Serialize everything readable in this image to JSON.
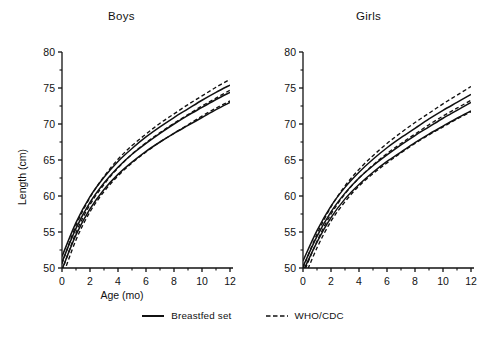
{
  "figure": {
    "panels": [
      {
        "key": "boys",
        "title": "Boys"
      },
      {
        "key": "girls",
        "title": "Girls"
      }
    ],
    "axis_label_x": "Age (mo)",
    "axis_label_y": "Length (cm)"
  },
  "legend": {
    "items": [
      {
        "label": "Breastfed set",
        "style": "solid",
        "icon": "solid-line-icon"
      },
      {
        "label": "WHO/CDC",
        "style": "dashed",
        "icon": "dashed-line-icon"
      }
    ]
  },
  "axes": {
    "x_ticks": [
      "0",
      "2",
      "4",
      "6",
      "8",
      "10",
      "12"
    ],
    "y_ticks": [
      "50",
      "55",
      "60",
      "65",
      "70",
      "75",
      "80"
    ],
    "xlim": [
      0,
      12
    ],
    "ylim": [
      50,
      80
    ]
  },
  "chart_data": {
    "type": "line",
    "title": "",
    "xlabel": "Age (mo)",
    "ylabel": "Length (cm)",
    "xlim": [
      0,
      12
    ],
    "ylim": [
      50,
      80
    ],
    "x_ticks": [
      0,
      2,
      4,
      6,
      8,
      10,
      12
    ],
    "y_ticks": [
      50,
      55,
      60,
      65,
      70,
      75,
      80
    ],
    "grid": false,
    "legend_position": "bottom-center",
    "legend": [
      "Breastfed set",
      "WHO/CDC"
    ],
    "panels": [
      {
        "name": "Boys",
        "x": [
          0,
          1,
          2,
          3,
          4,
          5,
          6,
          7,
          8,
          9,
          10,
          11,
          12
        ],
        "series": [
          {
            "name": "Breastfed set upper",
            "group": "Breastfed set",
            "style": "solid",
            "values": [
              51.6,
              56.3,
              59.9,
              62.6,
              64.8,
              66.6,
              68.2,
              69.6,
              70.9,
              72.1,
              73.3,
              74.4,
              75.4
            ]
          },
          {
            "name": "Breastfed set median",
            "group": "Breastfed set",
            "style": "solid",
            "values": [
              50.8,
              55.5,
              59.1,
              61.8,
              64.0,
              65.8,
              67.3,
              68.7,
              70.0,
              71.2,
              72.3,
              73.4,
              74.4
            ]
          },
          {
            "name": "Breastfed set lower",
            "group": "Breastfed set",
            "style": "solid",
            "values": [
              49.8,
              54.6,
              58.2,
              60.9,
              63.0,
              64.7,
              66.2,
              67.5,
              68.7,
              69.8,
              70.9,
              72.0,
              73.0
            ]
          },
          {
            "name": "WHO/CDC upper",
            "group": "WHO/CDC",
            "style": "dashed",
            "values": [
              50.6,
              55.9,
              59.8,
              62.7,
              65.1,
              67.0,
              68.6,
              70.1,
              71.4,
              72.7,
              73.9,
              75.1,
              76.2
            ]
          },
          {
            "name": "WHO/CDC median",
            "group": "WHO/CDC",
            "style": "dashed",
            "values": [
              49.6,
              54.9,
              58.8,
              61.6,
              63.9,
              65.8,
              67.4,
              68.8,
              70.1,
              71.3,
              72.5,
              73.6,
              74.7
            ]
          },
          {
            "name": "WHO/CDC lower",
            "group": "WHO/CDC",
            "style": "dashed",
            "values": [
              48.6,
              53.9,
              57.8,
              60.6,
              62.8,
              64.6,
              66.1,
              67.5,
              68.7,
              69.9,
              71.1,
              72.2,
              73.2
            ]
          }
        ],
        "value_at_12mo": {
          "breastfed_upper": 75.4,
          "breastfed_median": 74.4,
          "breastfed_lower": 73.0,
          "whocdc_upper": 76.2,
          "whocdc_median": 74.7,
          "whocdc_lower": 73.2
        }
      },
      {
        "name": "Girls",
        "x": [
          0,
          1,
          2,
          3,
          4,
          5,
          6,
          7,
          8,
          9,
          10,
          11,
          12
        ],
        "series": [
          {
            "name": "Breastfed set upper",
            "group": "Breastfed set",
            "style": "solid",
            "values": [
              51.0,
              55.2,
              58.6,
              61.2,
              63.3,
              65.1,
              66.7,
              68.1,
              69.4,
              70.7,
              71.9,
              73.0,
              74.1
            ]
          },
          {
            "name": "Breastfed set median",
            "group": "Breastfed set",
            "style": "solid",
            "values": [
              50.2,
              54.4,
              57.8,
              60.4,
              62.5,
              64.2,
              65.7,
              67.1,
              68.4,
              69.6,
              70.8,
              71.9,
              73.0
            ]
          },
          {
            "name": "Breastfed set lower",
            "group": "Breastfed set",
            "style": "solid",
            "values": [
              49.5,
              53.6,
              57.0,
              59.6,
              61.6,
              63.3,
              64.8,
              66.1,
              67.4,
              68.6,
              69.7,
              70.8,
              71.8
            ]
          },
          {
            "name": "WHO/CDC upper",
            "group": "WHO/CDC",
            "style": "dashed",
            "values": [
              50.0,
              54.7,
              58.5,
              61.4,
              63.7,
              65.6,
              67.3,
              68.8,
              70.2,
              71.5,
              72.8,
              74.0,
              75.2
            ]
          },
          {
            "name": "WHO/CDC median",
            "group": "WHO/CDC",
            "style": "dashed",
            "values": [
              49.1,
              53.7,
              57.5,
              60.3,
              62.5,
              64.3,
              65.9,
              67.3,
              68.6,
              69.9,
              71.1,
              72.2,
              73.3
            ]
          },
          {
            "name": "WHO/CDC lower",
            "group": "WHO/CDC",
            "style": "dashed",
            "values": [
              48.2,
              52.8,
              56.5,
              59.2,
              61.4,
              63.1,
              64.6,
              66.0,
              67.3,
              68.5,
              69.6,
              70.7,
              71.7
            ]
          }
        ],
        "value_at_12mo": {
          "breastfed_upper": 74.1,
          "breastfed_median": 73.0,
          "breastfed_lower": 71.8,
          "whocdc_upper": 75.2,
          "whocdc_median": 73.3,
          "whocdc_lower": 71.7
        }
      }
    ]
  }
}
